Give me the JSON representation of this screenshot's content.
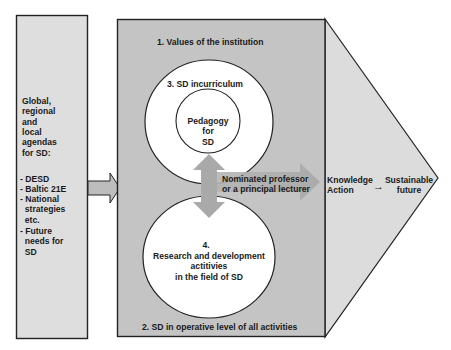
{
  "colors": {
    "background": "#ffffff",
    "left_box_fill": "#dedede",
    "middle_box_fill": "#c4c4c4",
    "triangle_fill": "#dcdcdc",
    "circle_fill": "#ffffff",
    "arrow_fill": "#b0b0b0",
    "outline": "#222222",
    "text": "#1a1a1a"
  },
  "left_box": {
    "heading": "Global,\nregional\nand\nlocal\nagendas\nfor SD:",
    "items": [
      "- DESD",
      "- Baltic 21E",
      "- National\n  strategies\n  etc."
    ],
    "future": "- Future\n  needs for\n  SD"
  },
  "middle_box": {
    "top_label": "1. Values of the institution",
    "bottom_label": "2. SD in operative level of all activities",
    "upper_circle": {
      "label": "3. SD incurriculum",
      "inner_label": "Pedagogy\nfor\nSD"
    },
    "lower_circle": {
      "number": "4.",
      "label": "Research and development\nactitivies\nin the field of SD"
    },
    "connector_label": "Nominated professor\nor a principal lecturer"
  },
  "triangle": {
    "left_text": "Knowledge\nAction",
    "arrow_glyph": "→",
    "right_text": "Sustainable\nfuture"
  }
}
